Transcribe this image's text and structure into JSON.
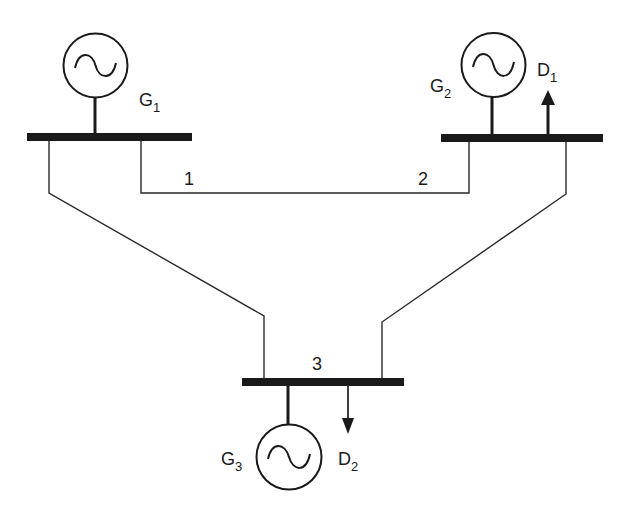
{
  "diagram": {
    "title": "",
    "colors": {
      "ink": "#1a1a1a",
      "background": "#ffffff"
    },
    "buses": [
      {
        "id": "bus-1",
        "label": "1"
      },
      {
        "id": "bus-2",
        "label": "2"
      },
      {
        "id": "bus-3",
        "label": "3"
      }
    ],
    "generators": [
      {
        "id": "G1",
        "main": "G",
        "sub": "1",
        "bus": "1"
      },
      {
        "id": "G2",
        "main": "G",
        "sub": "2",
        "bus": "2"
      },
      {
        "id": "G3",
        "main": "G",
        "sub": "3",
        "bus": "3"
      }
    ],
    "demands": [
      {
        "id": "D1",
        "main": "D",
        "sub": "1",
        "bus": "2",
        "arrow": "up"
      },
      {
        "id": "D2",
        "main": "D",
        "sub": "2",
        "bus": "3",
        "arrow": "down"
      }
    ],
    "lines": [
      {
        "from": "1",
        "to": "2"
      },
      {
        "from": "1",
        "to": "3"
      },
      {
        "from": "2",
        "to": "3"
      }
    ]
  }
}
